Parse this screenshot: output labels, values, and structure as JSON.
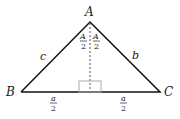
{
  "diagram": {
    "vertices": {
      "A": {
        "label": "A",
        "x": 90,
        "y": 22
      },
      "B": {
        "label": "B",
        "x": 21,
        "y": 92
      },
      "C": {
        "label": "C",
        "x": 160,
        "y": 92
      }
    },
    "sides": {
      "c": "c",
      "b": "b"
    },
    "half_angles": {
      "left": {
        "num": "A",
        "den": "2"
      },
      "right": {
        "num": "A",
        "den": "2"
      }
    },
    "half_bases": {
      "left": {
        "num": "a",
        "den": "2"
      },
      "right": {
        "num": "a",
        "den": "2"
      }
    },
    "colors": {
      "line": "#111111",
      "dashed": "#555555",
      "right_angle_box": "#aaaaaa"
    }
  }
}
